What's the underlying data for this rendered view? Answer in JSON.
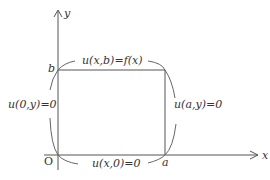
{
  "diagram": {
    "axes": {
      "x_label": "x",
      "y_label": "y",
      "origin_label": "O"
    },
    "points": {
      "a_label": "a",
      "b_label": "b"
    },
    "boundary_conditions": {
      "top": "u(x,b)=f(x)",
      "left": "u(0,y)=0",
      "right": "u(a,y)=0",
      "bottom": "u(x,0)=0"
    },
    "colors": {
      "stroke": "#555555",
      "text": "#333333"
    }
  }
}
